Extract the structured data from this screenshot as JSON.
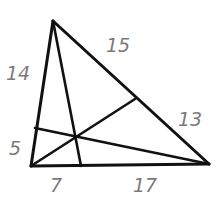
{
  "diagram": {
    "type": "triangle-with-concurrent-cevians",
    "colors": {
      "lines": "#111111",
      "labels": "#7a7a7a",
      "background": "#ffffff"
    },
    "vertices": {
      "top": [
        53,
        21
      ],
      "bottom_left": [
        31,
        166
      ],
      "bottom_right": [
        209,
        164
      ]
    },
    "cevian_feet": {
      "on_right_side": [
        135,
        99
      ],
      "on_left_side": [
        35,
        128
      ],
      "on_base": [
        81,
        166
      ]
    },
    "labels": {
      "left_upper": "14",
      "left_lower": "5",
      "right_upper": "15",
      "right_lower": "13",
      "base_left": "7",
      "base_right": "17"
    }
  }
}
